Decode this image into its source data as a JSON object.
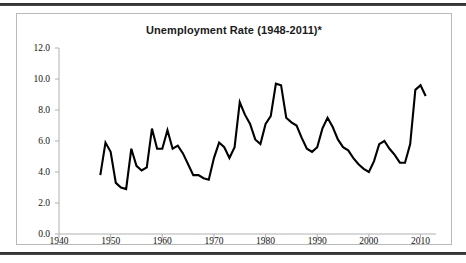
{
  "chart_data": {
    "type": "line",
    "title": "Unemployment Rate (1948-2011)*",
    "xlabel": "",
    "ylabel": "",
    "xlim": [
      1940,
      2013
    ],
    "ylim": [
      0.0,
      12.0
    ],
    "grid": false,
    "legend": "none",
    "series_color": "#000000",
    "ytick_labels": [
      "12.0",
      "10.0",
      "8.0",
      "6.0",
      "4.0",
      "2.0",
      "0.0"
    ],
    "ytick_values": [
      12.0,
      10.0,
      8.0,
      6.0,
      4.0,
      2.0,
      0.0
    ],
    "xtick_labels": [
      "1940",
      "1950",
      "1960",
      "1970",
      "1980",
      "1990",
      "2000",
      "2010"
    ],
    "xtick_values": [
      1940,
      1950,
      1960,
      1970,
      1980,
      1990,
      2000,
      2010
    ],
    "x": [
      1948,
      1949,
      1950,
      1951,
      1952,
      1953,
      1954,
      1955,
      1956,
      1957,
      1958,
      1959,
      1960,
      1961,
      1962,
      1963,
      1964,
      1965,
      1966,
      1967,
      1968,
      1969,
      1970,
      1971,
      1972,
      1973,
      1974,
      1975,
      1976,
      1977,
      1978,
      1979,
      1980,
      1981,
      1982,
      1983,
      1984,
      1985,
      1986,
      1987,
      1988,
      1989,
      1990,
      1991,
      1992,
      1993,
      1994,
      1995,
      1996,
      1997,
      1998,
      1999,
      2000,
      2001,
      2002,
      2003,
      2004,
      2005,
      2006,
      2007,
      2008,
      2009,
      2010,
      2011
    ],
    "values": [
      3.8,
      5.9,
      5.3,
      3.3,
      3.0,
      2.9,
      5.5,
      4.4,
      4.1,
      4.3,
      6.8,
      5.5,
      5.5,
      6.7,
      5.5,
      5.7,
      5.2,
      4.5,
      3.8,
      3.8,
      3.6,
      3.5,
      4.9,
      5.9,
      5.6,
      4.9,
      5.6,
      8.5,
      7.7,
      7.1,
      6.1,
      5.8,
      7.1,
      7.6,
      9.7,
      9.6,
      7.5,
      7.2,
      7.0,
      6.2,
      5.5,
      5.3,
      5.6,
      6.8,
      7.5,
      6.9,
      6.1,
      5.6,
      5.4,
      4.9,
      4.5,
      4.2,
      4.0,
      4.7,
      5.8,
      6.0,
      5.5,
      5.1,
      4.6,
      4.6,
      5.8,
      9.3,
      9.6,
      8.9
    ]
  }
}
